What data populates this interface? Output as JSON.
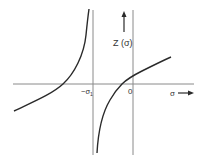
{
  "figure": {
    "type": "function-plot",
    "function_label": "Z (σ)",
    "x_axis_label": "σ",
    "tick_labels": {
      "pole": "−σ",
      "pole_subscript": "1",
      "origin": "0"
    },
    "colors": {
      "axis": "#8a8a8a",
      "curve": "#2a2a2a",
      "text": "#333333",
      "background": "#ffffff"
    },
    "features": {
      "vertical_asymptote_at": "−σ1",
      "left_branch": "rises from lower-left, crosses σ-axis left of −σ1, goes to +∞ approaching −σ1",
      "right_branch": "rises from −∞ just right of −σ1, crosses σ-axis between −σ1 and 0, continues increasing past 0"
    }
  }
}
